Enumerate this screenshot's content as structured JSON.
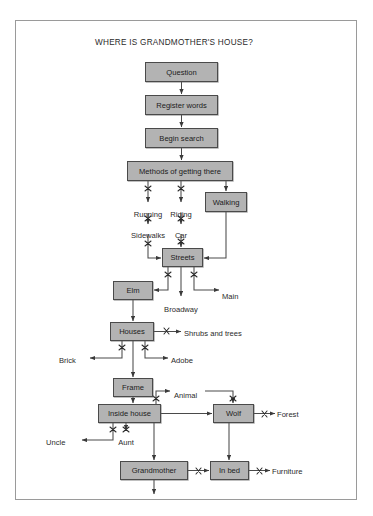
{
  "title": "WHERE IS GRANDMOTHER'S HOUSE?",
  "colors": {
    "node_fill": "#b3b3b3",
    "node_stroke": "#4a4a4a",
    "line": "#4a4a4a",
    "frame": "#9a9a9a",
    "text": "#1c1c1c",
    "page_background": "#ffffff"
  },
  "nodes": [
    {
      "id": "question",
      "label": "Question",
      "x": 145,
      "y": 62,
      "w": 73,
      "h": 20
    },
    {
      "id": "register",
      "label": "Register words",
      "x": 145,
      "y": 95,
      "w": 73,
      "h": 20
    },
    {
      "id": "begin",
      "label": "Begin search",
      "x": 145,
      "y": 128,
      "w": 73,
      "h": 20
    },
    {
      "id": "methods",
      "label": "Methods of getting there",
      "x": 127,
      "y": 161,
      "w": 106,
      "h": 20
    },
    {
      "id": "walking",
      "label": "Walking",
      "x": 205,
      "y": 192,
      "w": 42,
      "h": 20
    },
    {
      "id": "streets",
      "label": "Streets",
      "x": 162,
      "y": 248,
      "w": 41,
      "h": 19
    },
    {
      "id": "elm",
      "label": "Elm",
      "x": 113,
      "y": 281,
      "w": 40,
      "h": 19
    },
    {
      "id": "houses",
      "label": "Houses",
      "x": 110,
      "y": 322,
      "w": 44,
      "h": 19
    },
    {
      "id": "frame-node",
      "label": "Frame",
      "x": 113,
      "y": 378,
      "w": 40,
      "h": 19
    },
    {
      "id": "inside-house",
      "label": "Inside house",
      "x": 98,
      "y": 404,
      "w": 63,
      "h": 19
    },
    {
      "id": "wolf",
      "label": "Wolf",
      "x": 213,
      "y": 404,
      "w": 41,
      "h": 19
    },
    {
      "id": "grandmother",
      "label": "Grandmother",
      "x": 120,
      "y": 461,
      "w": 68,
      "h": 19
    },
    {
      "id": "in-bed",
      "label": "In bed",
      "x": 210,
      "y": 461,
      "w": 39,
      "h": 19
    }
  ],
  "labels": [
    {
      "id": "running",
      "text": "Running",
      "x": 148,
      "y": 210,
      "align": "center"
    },
    {
      "id": "riding",
      "text": "Riding",
      "x": 181,
      "y": 210,
      "align": "center"
    },
    {
      "id": "sidewalks",
      "text": "Sidewalks",
      "x": 148,
      "y": 231,
      "align": "center"
    },
    {
      "id": "car",
      "text": "Car",
      "x": 181,
      "y": 231,
      "align": "center"
    },
    {
      "id": "main",
      "text": "Main",
      "x": 222,
      "y": 292,
      "align": "left"
    },
    {
      "id": "broadway",
      "text": "Broadway",
      "x": 181,
      "y": 305,
      "align": "center"
    },
    {
      "id": "shrubs",
      "text": "Shrubs and trees",
      "x": 184,
      "y": 329,
      "align": "left"
    },
    {
      "id": "brick",
      "text": "Brick",
      "x": 59,
      "y": 356,
      "align": "left"
    },
    {
      "id": "adobe",
      "text": "Adobe",
      "x": 171,
      "y": 356,
      "align": "left"
    },
    {
      "id": "animal",
      "text": "Animal",
      "x": 174,
      "y": 391,
      "align": "left"
    },
    {
      "id": "forest",
      "text": "Forest",
      "x": 277,
      "y": 410,
      "align": "left"
    },
    {
      "id": "uncle",
      "text": "Uncle",
      "x": 46,
      "y": 438,
      "align": "left"
    },
    {
      "id": "aunt",
      "text": "Aunt",
      "x": 126,
      "y": 438,
      "align": "center"
    },
    {
      "id": "furniture",
      "text": "Furniture",
      "x": 272,
      "y": 467,
      "align": "left"
    }
  ],
  "connections": [
    {
      "from": "question",
      "to": "register",
      "crossed": false
    },
    {
      "from": "register",
      "to": "begin",
      "crossed": false
    },
    {
      "from": "begin",
      "to": "methods",
      "crossed": false
    },
    {
      "from": "methods",
      "to": "running",
      "crossed": true
    },
    {
      "from": "methods",
      "to": "riding",
      "crossed": true
    },
    {
      "from": "methods",
      "to": "walking",
      "crossed": false
    },
    {
      "from": "running",
      "to": "sidewalks",
      "crossed": true
    },
    {
      "from": "riding",
      "to": "car",
      "crossed": true
    },
    {
      "from": "sidewalks",
      "to": "streets",
      "crossed": true
    },
    {
      "from": "car",
      "to": "streets",
      "crossed": true
    },
    {
      "from": "walking",
      "to": "streets",
      "crossed": false
    },
    {
      "from": "streets",
      "to": "elm",
      "crossed": false
    },
    {
      "from": "streets",
      "to": "broadway",
      "crossed": true
    },
    {
      "from": "streets",
      "to": "main",
      "crossed": true
    },
    {
      "from": "elm",
      "to": "houses",
      "crossed": false
    },
    {
      "from": "houses",
      "to": "shrubs",
      "crossed": true
    },
    {
      "from": "houses",
      "to": "brick",
      "crossed": true
    },
    {
      "from": "houses",
      "to": "adobe",
      "crossed": true
    },
    {
      "from": "houses",
      "to": "frame-node",
      "crossed": false
    },
    {
      "from": "frame-node",
      "to": "inside-house",
      "crossed": false
    },
    {
      "from": "inside-house",
      "to": "animal",
      "crossed": true
    },
    {
      "from": "animal",
      "to": "wolf",
      "crossed": true
    },
    {
      "from": "inside-house",
      "to": "wolf",
      "crossed": false
    },
    {
      "from": "inside-house",
      "to": "uncle",
      "crossed": true
    },
    {
      "from": "inside-house",
      "to": "aunt",
      "crossed": true
    },
    {
      "from": "inside-house",
      "to": "grandmother",
      "crossed": false
    },
    {
      "from": "wolf",
      "to": "forest",
      "crossed": true
    },
    {
      "from": "wolf",
      "to": "in-bed",
      "crossed": false
    },
    {
      "from": "grandmother",
      "to": "in-bed",
      "crossed": true
    },
    {
      "from": "in-bed",
      "to": "furniture",
      "crossed": true
    },
    {
      "from": "grandmother",
      "to": "exit",
      "crossed": false
    }
  ]
}
